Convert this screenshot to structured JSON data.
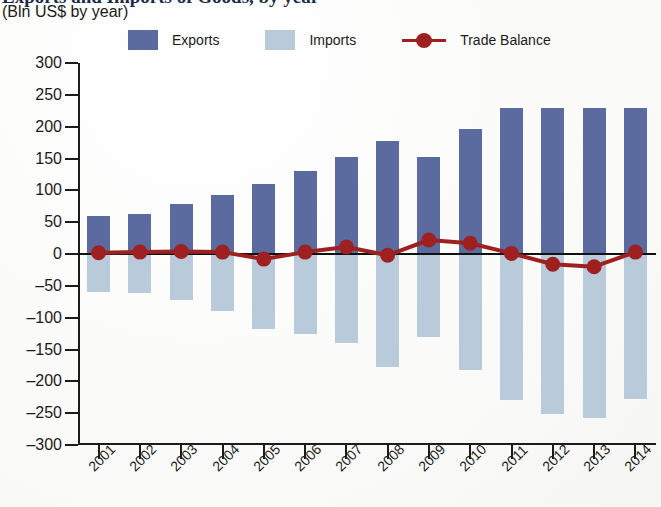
{
  "header": {
    "title": "Exports and Imports of Goods, by year",
    "subtitle": "(Bln US$ by year)"
  },
  "legend": {
    "position": "top",
    "items": [
      {
        "name": "exports",
        "label": "Exports",
        "color": "#5B6BA0",
        "marker": "square"
      },
      {
        "name": "imports",
        "label": "Imports",
        "color": "#B9CADB",
        "marker": "square"
      },
      {
        "name": "trade-balance",
        "label": "Trade Balance",
        "color": "#9E2020",
        "marker": "line-circle"
      }
    ]
  },
  "chart_data": {
    "type": "bar",
    "title": "Exports and Imports of Goods, by year",
    "subtitle": "(Bln US$ by year)",
    "xlabel": "",
    "ylabel": "(Bln US$ by year)",
    "grid": false,
    "legend_position": "top",
    "ylim": [
      -300,
      300
    ],
    "ytick_step": 50,
    "yticks": [
      300,
      250,
      200,
      150,
      100,
      50,
      0,
      -50,
      -100,
      -150,
      -200,
      -250,
      -300
    ],
    "ytick_labels": [
      "300",
      "250",
      "200",
      "150",
      "100",
      "50",
      "0",
      "–50",
      "–100",
      "–150",
      "–200",
      "–250",
      "–300"
    ],
    "categories": [
      "2001",
      "2002",
      "2003",
      "2004",
      "2005",
      "2006",
      "2007",
      "2008",
      "2009",
      "2010",
      "2011",
      "2012",
      "2013",
      "2014"
    ],
    "series": [
      {
        "name": "Exports",
        "type": "bar",
        "color": "#5B6BA0",
        "values": [
          60,
          63,
          78,
          93,
          110,
          130,
          153,
          177,
          153,
          197,
          230,
          230,
          230,
          229
        ]
      },
      {
        "name": "Imports",
        "type": "bar",
        "color": "#B9CADB",
        "values": [
          -60,
          -62,
          -72,
          -90,
          -118,
          -126,
          -140,
          -178,
          -131,
          -182,
          -229,
          -251,
          -257,
          -228
        ]
      },
      {
        "name": "Trade Balance",
        "type": "line",
        "color": "#9E2020",
        "values": [
          2,
          3,
          4,
          3,
          -8,
          3,
          11,
          -2,
          22,
          17,
          1,
          -16,
          -20,
          3
        ]
      }
    ]
  }
}
